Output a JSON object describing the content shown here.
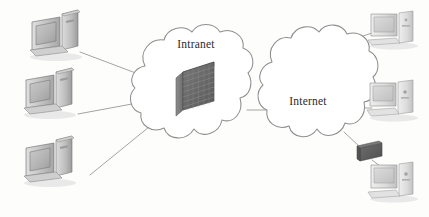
{
  "figure": {
    "background_color": "#fdfdfc",
    "width": 429,
    "height": 217
  },
  "clouds": [
    {
      "id": "intranet",
      "label": "Intranet",
      "label_x": 196,
      "label_y": 48,
      "outline_color": "#8e8e8e",
      "fill_color": "#ffffff"
    },
    {
      "id": "internet",
      "label": "Internet",
      "label_x": 308,
      "label_y": 105,
      "outline_color": "#8e8e8e",
      "fill_color": "#ffffff"
    }
  ],
  "devices": {
    "left_clients": [
      {
        "id": "left-pc-1",
        "type": "desktop-computer",
        "x": 28,
        "y": 10
      },
      {
        "id": "left-pc-2",
        "type": "desktop-computer",
        "x": 22,
        "y": 68
      },
      {
        "id": "left-pc-3",
        "type": "desktop-computer",
        "x": 22,
        "y": 136
      }
    ],
    "right_clients": [
      {
        "id": "right-pc-1",
        "type": "desktop-computer",
        "x": 362,
        "y": 12
      },
      {
        "id": "right-pc-2",
        "type": "desktop-computer",
        "x": 360,
        "y": 76
      },
      {
        "id": "right-pc-3",
        "type": "desktop-computer",
        "x": 362,
        "y": 158
      }
    ],
    "router": {
      "id": "edge-device",
      "type": "router-box",
      "x": 352,
      "y": 142,
      "color": "#5e5e5e"
    },
    "firewall": {
      "id": "firewall",
      "type": "brick-wall-firewall",
      "x": 176,
      "y": 66,
      "brick_color": "#6a6a6a",
      "brick_rows": 8,
      "brick_cols": 6
    }
  },
  "connections": [
    {
      "id": "link-left-pc-1",
      "from": "left-pc-1",
      "to": "firewall"
    },
    {
      "id": "link-left-pc-2",
      "from": "left-pc-2",
      "to": "firewall"
    },
    {
      "id": "link-left-pc-3",
      "from": "left-pc-3",
      "to": "firewall"
    },
    {
      "id": "link-intranet-internet",
      "from": "intranet",
      "to": "internet"
    },
    {
      "id": "link-internet-pc-1",
      "from": "internet",
      "to": "right-pc-1"
    },
    {
      "id": "link-internet-pc-2",
      "from": "internet",
      "to": "right-pc-2"
    },
    {
      "id": "link-internet-router",
      "from": "internet",
      "to": "edge-device"
    },
    {
      "id": "link-router-pc-3",
      "from": "edge-device",
      "to": "right-pc-3"
    }
  ]
}
